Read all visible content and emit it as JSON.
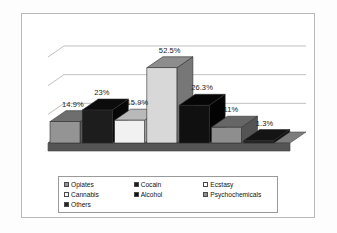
{
  "chart_data": {
    "type": "bar",
    "title": "",
    "subtitle": "",
    "xlabel": "",
    "ylabel": "",
    "ylim": [
      0,
      60
    ],
    "grid": true,
    "gridlines": [
      20,
      40,
      60
    ],
    "legend_position": "bottom",
    "style": "3d-column",
    "categories": [
      "Opiates",
      "Cocain",
      "Ecstasy",
      "Cannabis",
      "Alcohol",
      "Psychochemicals",
      "Others"
    ],
    "values": [
      14.9,
      23,
      15.9,
      52.5,
      26.3,
      11,
      1.3
    ],
    "data_labels": [
      "14.9%",
      "23%",
      "15.9%",
      "52.5%",
      "26.3%",
      "11%",
      "1.3%"
    ],
    "colors": [
      "#949494",
      "#1d1d1d",
      "#f1f1f1",
      "#d8d8d8",
      "#101010",
      "#8e8e8e",
      "#242424"
    ],
    "top_face_colors": [
      "#6e6e6e",
      "#0c0c0c",
      "#b9b9b9",
      "#8d8d8d",
      "#060606",
      "#666666",
      "#141414"
    ],
    "side_face_colors": [
      "#5a5a5a",
      "#070707",
      "#a0a0a0",
      "#777777",
      "#030303",
      "#545454",
      "#0e0e0e"
    ]
  },
  "chart": {
    "floor_color": "#555555",
    "floor_top_color": "#7d7d7d",
    "gridline_color": "#b0b0b0",
    "frame_border_color": "#b9b9b9",
    "background_color": "#ffffff"
  },
  "legend": {
    "border_color": "#9a9a9a",
    "items": [
      {
        "label": "Opiates",
        "swatch": "#949494"
      },
      {
        "label": "Cocain",
        "swatch": "#1d1d1d"
      },
      {
        "label": "Ecstasy",
        "swatch": "#ffffff"
      },
      {
        "label": "Cannabis",
        "swatch": "#f4f4f4"
      },
      {
        "label": "Alcohol",
        "swatch": "#101010"
      },
      {
        "label": "Psychochemicals",
        "swatch": "#8e8e8e"
      },
      {
        "label": "Others",
        "swatch": "#242424"
      }
    ]
  }
}
